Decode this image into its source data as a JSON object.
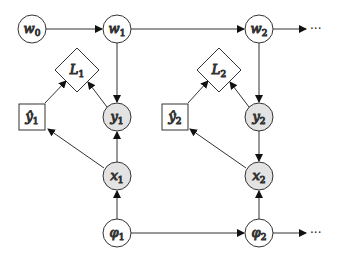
{
  "diagram": {
    "type": "graphical-model",
    "colors": {
      "stroke": "#333333",
      "observed_fill": "#e3e3e3",
      "latent_fill": "#ffffff"
    },
    "nodes": {
      "w0": {
        "base": "w",
        "sub": "0",
        "shape": "circle",
        "shaded": false
      },
      "w1": {
        "base": "w",
        "sub": "1",
        "shape": "circle",
        "shaded": false
      },
      "w2": {
        "base": "w",
        "sub": "2",
        "shape": "circle",
        "shaded": false
      },
      "L1": {
        "base": "L",
        "sub": "1",
        "shape": "diamond",
        "shaded": false
      },
      "L2": {
        "base": "L",
        "sub": "2",
        "shape": "diamond",
        "shaded": false
      },
      "yhat1": {
        "base": "ŷ",
        "sub": "1",
        "shape": "square",
        "shaded": false
      },
      "yhat2": {
        "base": "ŷ",
        "sub": "2",
        "shape": "square",
        "shaded": false
      },
      "y1": {
        "base": "y",
        "sub": "1",
        "shape": "circle",
        "shaded": true
      },
      "y2": {
        "base": "y",
        "sub": "2",
        "shape": "circle",
        "shaded": true
      },
      "x1": {
        "base": "x",
        "sub": "1",
        "shape": "circle",
        "shaded": true
      },
      "x2": {
        "base": "x",
        "sub": "2",
        "shape": "circle",
        "shaded": true
      },
      "phi1": {
        "base": "φ",
        "sub": "1",
        "shape": "circle",
        "shaded": false
      },
      "phi2": {
        "base": "φ",
        "sub": "2",
        "shape": "circle",
        "shaded": false
      }
    },
    "continuation": "···",
    "edges": [
      [
        "w0",
        "w1"
      ],
      [
        "w1",
        "w2"
      ],
      [
        "w2",
        "..."
      ],
      [
        "w1",
        "y1"
      ],
      [
        "w2",
        "y2"
      ],
      [
        "y1",
        "L1"
      ],
      [
        "yhat1",
        "L1"
      ],
      [
        "y2",
        "L2"
      ],
      [
        "yhat2",
        "L2"
      ],
      [
        "x1",
        "y1"
      ],
      [
        "y2",
        "x2"
      ],
      [
        "x1",
        "yhat1"
      ],
      [
        "x2",
        "yhat2"
      ],
      [
        "phi1",
        "x1"
      ],
      [
        "phi2",
        "x2"
      ],
      [
        "phi1",
        "phi2"
      ],
      [
        "phi2",
        "..."
      ]
    ]
  }
}
